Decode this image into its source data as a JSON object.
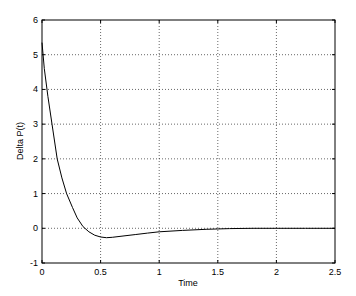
{
  "chart_data": {
    "type": "line",
    "title": "",
    "xlabel": "Time",
    "ylabel": "Delta P(t)",
    "xlim": [
      0,
      2.5
    ],
    "ylim": [
      -1,
      6
    ],
    "xticks": [
      0,
      0.5,
      1,
      1.5,
      2,
      2.5
    ],
    "xtick_labels": [
      "0",
      "0.5",
      "1",
      "1.5",
      "2",
      "2.5"
    ],
    "yticks": [
      -1,
      0,
      1,
      2,
      3,
      4,
      5,
      6
    ],
    "ytick_labels": [
      "-1",
      "0",
      "1",
      "2",
      "3",
      "4",
      "5",
      "6"
    ],
    "grid": true,
    "legend": null,
    "series": [
      {
        "name": "Delta P(t)",
        "color": "#000000",
        "x": [
          0,
          0.02,
          0.05,
          0.085,
          0.13,
          0.17,
          0.21,
          0.26,
          0.3,
          0.35,
          0.4,
          0.45,
          0.5,
          0.55,
          0.6,
          0.7,
          0.8,
          0.9,
          1.0,
          1.2,
          1.4,
          1.6,
          1.8,
          2.0,
          2.25,
          2.5
        ],
        "values": [
          5.35,
          4.6,
          3.8,
          3.0,
          2.0,
          1.45,
          1.0,
          0.6,
          0.3,
          0.05,
          -0.1,
          -0.2,
          -0.25,
          -0.27,
          -0.26,
          -0.22,
          -0.18,
          -0.14,
          -0.1,
          -0.06,
          -0.03,
          -0.01,
          0.0,
          0.0,
          0.0,
          0.0
        ]
      }
    ]
  }
}
